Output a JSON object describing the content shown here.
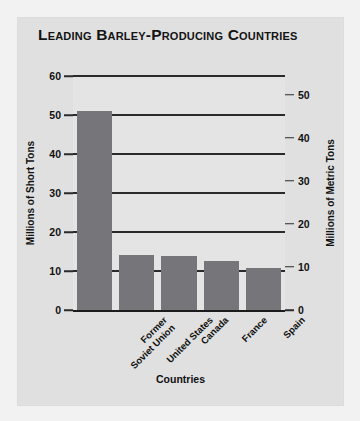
{
  "chart_data": {
    "type": "bar",
    "title": "Leading Barley-Producing Countries",
    "xlabel": "Countries",
    "ylabel": "Millions of Short Tons",
    "ylabel_secondary": "Millions of Metric Tons",
    "categories": [
      "Former Soviet Union",
      "United States",
      "Canada",
      "France",
      "Spain"
    ],
    "category_lines": [
      [
        "Former",
        "Soviet Union"
      ],
      [
        "United States"
      ],
      [
        "Canada"
      ],
      [
        "France"
      ],
      [
        "Spain"
      ]
    ],
    "values": [
      51,
      14,
      13.8,
      12.6,
      10.8
    ],
    "ylim": [
      0,
      60
    ],
    "yticks": [
      0,
      10,
      20,
      30,
      40,
      50,
      60
    ],
    "ylim_secondary": [
      0,
      54.4
    ],
    "yticks_secondary": [
      0,
      10,
      20,
      30,
      40,
      50
    ],
    "grid": true,
    "legend": "none",
    "bar_color": "#76767a",
    "plot_background": "#e4e4e4",
    "panel_background": "#e0e0e0",
    "page_background": "#f2f2f2",
    "axis_color": "#2a2a2a"
  }
}
